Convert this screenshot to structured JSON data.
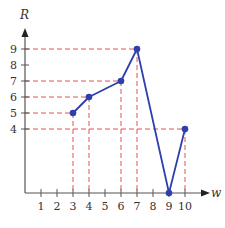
{
  "chart_data": {
    "type": "line",
    "title": "",
    "xlabel": "w",
    "ylabel": "R",
    "x": [
      3,
      4,
      6,
      7,
      9,
      10
    ],
    "y": [
      5,
      6,
      7,
      9,
      0,
      4
    ],
    "xticks": [
      1,
      2,
      3,
      4,
      5,
      6,
      7,
      8,
      9,
      10
    ],
    "yticks": [
      4,
      5,
      6,
      7,
      8,
      9
    ],
    "xlim": [
      0,
      11
    ],
    "ylim": [
      0,
      10
    ],
    "grid": false,
    "guide_lines": "dashed red projections from each point to both axes",
    "colors": {
      "series": "#2e3fae",
      "guides": "#e05050",
      "axis": "#555555"
    }
  }
}
